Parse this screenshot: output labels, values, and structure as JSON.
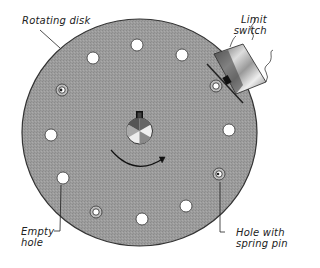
{
  "diagram": {
    "type": "mechanical-illustration",
    "disk": {
      "label": "Rotating disk",
      "fill": "#9a9a9a",
      "stroke": "#333333"
    },
    "limit_switch": {
      "label_line1": "Limit",
      "label_line2": "switch"
    },
    "empty_hole": {
      "label_line1": "Empty",
      "label_line2": "hole"
    },
    "spring_pin_hole": {
      "label_line1": "Hole with",
      "label_line2": "spring pin"
    },
    "rotation_direction": "clockwise",
    "hole_count": 12,
    "holes": [
      {
        "x": 137,
        "y": 45,
        "kind": "empty"
      },
      {
        "x": 182,
        "y": 55,
        "kind": "empty"
      },
      {
        "x": 216,
        "y": 86,
        "kind": "spring-pin"
      },
      {
        "x": 229,
        "y": 130,
        "kind": "empty"
      },
      {
        "x": 219,
        "y": 174,
        "kind": "spring-pin"
      },
      {
        "x": 186,
        "y": 206,
        "kind": "empty"
      },
      {
        "x": 142,
        "y": 219,
        "kind": "empty"
      },
      {
        "x": 96,
        "y": 212,
        "kind": "spring-pin"
      },
      {
        "x": 63,
        "y": 178,
        "kind": "empty"
      },
      {
        "x": 51,
        "y": 135,
        "kind": "empty"
      },
      {
        "x": 62,
        "y": 90,
        "kind": "spring-pin"
      },
      {
        "x": 93,
        "y": 58,
        "kind": "empty"
      }
    ]
  }
}
